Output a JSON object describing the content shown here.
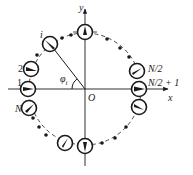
{
  "diagram": {
    "title": "",
    "center_label": "O",
    "axes": {
      "x_label": "x",
      "y_label": "y"
    },
    "angle_label": "φ",
    "angle_subscript": "i",
    "colors": {
      "stroke": "#1a1a1a",
      "background": "#ffffff"
    },
    "elements": [
      {
        "label": "i",
        "angle_deg": 128
      },
      {
        "label": "2",
        "angle_deg": 160
      },
      {
        "label": "1",
        "angle_deg": 180
      },
      {
        "label": "N",
        "angle_deg": 199
      },
      {
        "label": "N/2",
        "angle_deg": 18
      },
      {
        "label": "N/2 + 1",
        "angle_deg": 0
      }
    ],
    "labels": {
      "i": "i",
      "two": "2",
      "one": "1",
      "N": "N",
      "N_half": "N/2",
      "N_half_plus_one": "N/2 + 1"
    }
  }
}
